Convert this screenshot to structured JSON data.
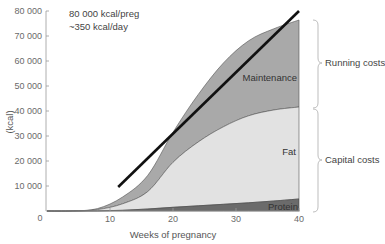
{
  "chart_data": {
    "type": "area",
    "title": "",
    "xlabel": "Weeks of pregnancy",
    "ylabel": "(kcal)",
    "xlim": [
      0,
      40
    ],
    "ylim": [
      0,
      80000
    ],
    "x_ticks": [
      10,
      20,
      30,
      40
    ],
    "x_tick_labels": [
      "10",
      "20",
      "30",
      "40"
    ],
    "y_ticks": [
      0,
      10000,
      20000,
      30000,
      40000,
      50000,
      60000,
      70000,
      80000
    ],
    "y_tick_labels": [
      "0",
      "10 000",
      "20 000",
      "30 000",
      "40 000",
      "50 000",
      "60 000",
      "70 000",
      "80 000"
    ],
    "grid": false,
    "stacked": true,
    "x": [
      0,
      4,
      8,
      12,
      16,
      20,
      24,
      28,
      32,
      36,
      40
    ],
    "series": [
      {
        "name": "Protein",
        "color": "#6b6b6b",
        "values": [
          0,
          0,
          50,
          300,
          800,
          1500,
          2100,
          2700,
          3300,
          4000,
          4800
        ]
      },
      {
        "name": "Fat",
        "color": "#e2e2e2",
        "values": [
          0,
          20,
          500,
          2600,
          7000,
          18000,
          25500,
          31000,
          34800,
          36400,
          36800
        ]
      },
      {
        "name": "Maintenance",
        "color": "#a9a9a9",
        "values": [
          0,
          30,
          400,
          2700,
          6500,
          12000,
          19000,
          25500,
          30000,
          32500,
          34800
        ]
      }
    ],
    "cumulative_tops": {
      "protein": [
        0,
        0,
        50,
        300,
        800,
        1500,
        2100,
        2700,
        3300,
        4000,
        4800
      ],
      "fat": [
        0,
        20,
        550,
        2900,
        7800,
        19500,
        27600,
        33700,
        38100,
        40400,
        41600
      ],
      "maintenance": [
        0,
        50,
        950,
        5600,
        14300,
        31500,
        46600,
        59200,
        68100,
        72900,
        76400
      ]
    },
    "trend_line": {
      "x": [
        11.3,
        40
      ],
      "y": [
        9600,
        80000
      ],
      "color": "#111111"
    },
    "annotations": [
      "80 000 kcal/preg",
      "~350 kcal/day"
    ],
    "brackets": [
      {
        "label": "Running costs",
        "from": 41600,
        "to": 76400
      },
      {
        "label": "Capital costs",
        "from": 0,
        "to": 41600
      }
    ],
    "legend": "inline region labels"
  },
  "labels": {
    "annotation_line1": "80 000 kcal/preg",
    "annotation_line2": "~350 kcal/day",
    "maintenance": "Maintenance",
    "fat": "Fat",
    "protein": "Protein",
    "running_costs": "Running costs",
    "capital_costs": "Capital costs",
    "xlabel": "Weeks of pregnancy",
    "ylabel": "(kcal)",
    "x0_label": "0"
  }
}
